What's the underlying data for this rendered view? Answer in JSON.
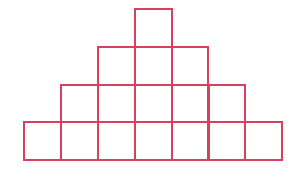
{
  "diagram": {
    "title": "",
    "line_color": "#d8405e",
    "background": "#ffffff",
    "line_width": 2,
    "origin_x": 24,
    "origin_y": 9,
    "cell_width": 36.9,
    "cell_height": 37.75,
    "columns": 7,
    "rows": [
      {
        "row": 1,
        "count": 1,
        "start_col": 3
      },
      {
        "row": 2,
        "count": 3,
        "start_col": 2
      },
      {
        "row": 3,
        "count": 5,
        "start_col": 1
      },
      {
        "row": 4,
        "count": 7,
        "start_col": 0
      }
    ],
    "total_squares": 16
  }
}
